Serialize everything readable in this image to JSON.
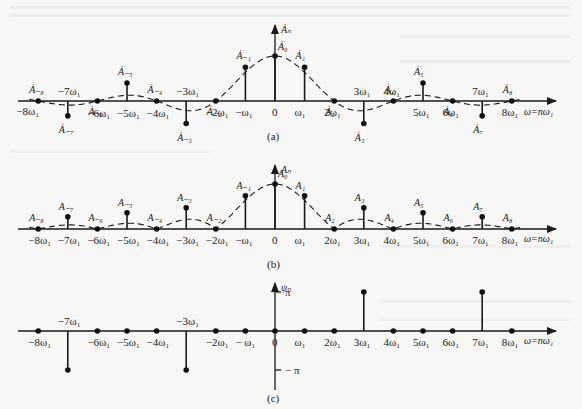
{
  "figure": {
    "panels": [
      {
        "id": "a",
        "caption": "(a)",
        "y_axis_label": "Ȧₙ",
        "x_axis_label": "ω=nω₁",
        "kind": "complex-amplitude-spectrum",
        "lines": [
          {
            "n": -8,
            "value": 0,
            "label": "Ȧ₋₈",
            "tick": "−8ω₁"
          },
          {
            "n": -7,
            "value": -0.33,
            "label": "Ȧ₋₇",
            "tick": "−7ω₁"
          },
          {
            "n": -6,
            "value": 0,
            "label": "Ȧ₋₆",
            "tick": "−6ω₁"
          },
          {
            "n": -5,
            "value": 0.4,
            "label": "Ȧ₋₅",
            "tick": "−5ω₁"
          },
          {
            "n": -4,
            "value": 0,
            "label": "Ȧ₋₄",
            "tick": "−4ω₁"
          },
          {
            "n": -3,
            "value": -0.5,
            "label": "Ȧ₋₃",
            "tick": "−3ω₁"
          },
          {
            "n": -2,
            "value": 0,
            "label": "Ȧ₋₂",
            "tick": "−2ω₁"
          },
          {
            "n": -1,
            "value": 0.75,
            "label": "Ȧ₋₁",
            "tick": "−ω₁"
          },
          {
            "n": 0,
            "value": 1.0,
            "label": "Ȧ₀",
            "tick": "0"
          },
          {
            "n": 1,
            "value": 0.75,
            "label": "Ȧ₁",
            "tick": "ω₁"
          },
          {
            "n": 2,
            "value": 0,
            "label": "Ȧ₂",
            "tick": "2ω₁"
          },
          {
            "n": 3,
            "value": -0.5,
            "label": "Ȧ₃",
            "tick": "3ω₁"
          },
          {
            "n": 4,
            "value": 0,
            "label": "Ȧ₄",
            "tick": "4ω₁"
          },
          {
            "n": 5,
            "value": 0.4,
            "label": "Ȧ₅",
            "tick": "5ω₁"
          },
          {
            "n": 6,
            "value": 0,
            "label": "Ȧ₆",
            "tick": "6ω₁"
          },
          {
            "n": 7,
            "value": -0.33,
            "label": "Ȧ₇",
            "tick": "7ω₁"
          },
          {
            "n": 8,
            "value": 0,
            "label": "Ȧ₈",
            "tick": "8ω₁"
          }
        ]
      },
      {
        "id": "b",
        "caption": "(b)",
        "y_axis_label": "Aₙ",
        "x_axis_label": "ω=nω₁",
        "kind": "magnitude-spectrum",
        "lines": [
          {
            "n": -8,
            "value": 0,
            "label": "A₋₈",
            "tick": "−8ω₁"
          },
          {
            "n": -7,
            "value": 0.27,
            "label": "A₋₇",
            "tick": "−7ω₁"
          },
          {
            "n": -6,
            "value": 0,
            "label": "A₋₆",
            "tick": "−6ω₁"
          },
          {
            "n": -5,
            "value": 0.36,
            "label": "A₋₅",
            "tick": "−5ω₁"
          },
          {
            "n": -4,
            "value": 0,
            "label": "A₋₄",
            "tick": "−4ω₁"
          },
          {
            "n": -3,
            "value": 0.47,
            "label": "A₋₃",
            "tick": "−3ω₁"
          },
          {
            "n": -2,
            "value": 0,
            "label": "A₋₂",
            "tick": "−2ω₁"
          },
          {
            "n": -1,
            "value": 0.74,
            "label": "A₋₁",
            "tick": "−ω₁"
          },
          {
            "n": 0,
            "value": 1.0,
            "label": "A₀",
            "tick": "0"
          },
          {
            "n": 1,
            "value": 0.74,
            "label": "A₁",
            "tick": "ω₁"
          },
          {
            "n": 2,
            "value": 0,
            "label": "A₂",
            "tick": "2ω₁"
          },
          {
            "n": 3,
            "value": 0.47,
            "label": "A₃",
            "tick": "3ω₁"
          },
          {
            "n": 4,
            "value": 0,
            "label": "A₄",
            "tick": "4ω₁"
          },
          {
            "n": 5,
            "value": 0.36,
            "label": "A₅",
            "tick": "5ω₁"
          },
          {
            "n": 6,
            "value": 0,
            "label": "A₆",
            "tick": "6ω₁"
          },
          {
            "n": 7,
            "value": 0.27,
            "label": "A₇",
            "tick": "7ω₁"
          },
          {
            "n": 8,
            "value": 0,
            "label": "A₈",
            "tick": "8ω₁"
          }
        ]
      },
      {
        "id": "c",
        "caption": "(c)",
        "y_axis_label": "ψₙ",
        "x_axis_label": "ω=nω₁",
        "kind": "phase-spectrum",
        "y_ticks": [
          "π",
          "− π"
        ],
        "lines": [
          {
            "n": -8,
            "value": 0,
            "tick": "−8ω₁"
          },
          {
            "n": -7,
            "value": -1,
            "tick": "−7ω₁"
          },
          {
            "n": -6,
            "value": 0,
            "tick": "−6ω₁"
          },
          {
            "n": -5,
            "value": 0,
            "tick": "−5ω₁"
          },
          {
            "n": -4,
            "value": 0,
            "tick": "−4ω₁"
          },
          {
            "n": -3,
            "value": -1,
            "tick": "−3ω₁"
          },
          {
            "n": -2,
            "value": 0,
            "tick": "−2ω₁"
          },
          {
            "n": -1,
            "value": 0,
            "tick": "− ω₁"
          },
          {
            "n": 0,
            "value": 0,
            "tick": "0"
          },
          {
            "n": 1,
            "value": 0,
            "tick": "ω₁"
          },
          {
            "n": 2,
            "value": 0,
            "tick": "2ω₁"
          },
          {
            "n": 3,
            "value": 1,
            "tick": "3ω₁"
          },
          {
            "n": 4,
            "value": 0,
            "tick": "4ω₁"
          },
          {
            "n": 5,
            "value": 0,
            "tick": "5ω₁"
          },
          {
            "n": 6,
            "value": 0,
            "tick": "6ω₁"
          },
          {
            "n": 7,
            "value": 1,
            "tick": "7ω₁"
          },
          {
            "n": 8,
            "value": 0,
            "tick": "8ω₁"
          }
        ],
        "value_unit": "π"
      }
    ]
  }
}
